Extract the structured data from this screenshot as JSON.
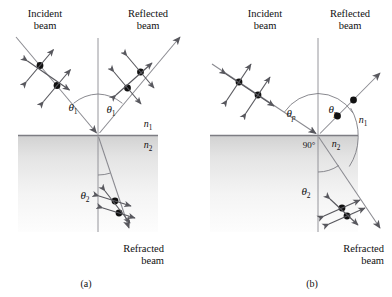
{
  "figure": {
    "type": "physics-optics-diagram",
    "width": 392,
    "height": 297,
    "background": "#ffffff",
    "ray_color": "#6e6e74",
    "arrow_color": "#58585e",
    "dot_color": "#111111",
    "interface_line_color": "#7d7d83",
    "medium_fill_top": "#d5d5d5",
    "medium_fill_bottom": "#fdfdfd"
  },
  "panels": [
    {
      "id": "a",
      "caption": "(a)",
      "incident_label_line1": "Incident",
      "incident_label_line2": "beam",
      "reflected_label_line1": "Reflected",
      "reflected_label_line2": "beam",
      "refracted_label_line1": "Refracted",
      "refracted_label_line2": "beam",
      "index_upper": "n",
      "index_upper_sub": "1",
      "index_lower": "n",
      "index_lower_sub": "2",
      "angle_incident": "θ",
      "angle_incident_sub": "1",
      "angle_reflected": "θ",
      "angle_reflected_sub": "1",
      "angle_refracted": "θ",
      "angle_refracted_sub": "2",
      "incidence_degrees": 40,
      "refraction_degrees": 12,
      "incident_polarization": "unpolarized",
      "reflected_polarization": "unpolarized",
      "refracted_polarization": "unpolarized"
    },
    {
      "id": "b",
      "caption": "(b)",
      "incident_label_line1": "Incident",
      "incident_label_line2": "beam",
      "reflected_label_line1": "Reflected",
      "reflected_label_line2": "beam",
      "refracted_label_line1": "Refracted",
      "refracted_label_line2": "beam",
      "index_upper": "n",
      "index_upper_sub": "1",
      "index_lower": "n",
      "index_lower_sub": "2",
      "angle_incident": "θ",
      "angle_incident_sub": "p",
      "angle_reflected": "θ",
      "angle_reflected_sub": "p",
      "angle_refracted": "θ",
      "angle_refracted_sub": "2",
      "right_angle_label": "90°",
      "incidence_degrees": 56,
      "refraction_degrees": 34,
      "incident_polarization": "unpolarized",
      "reflected_polarization": "perpendicular-only",
      "refracted_polarization": "partially-polarized"
    }
  ]
}
